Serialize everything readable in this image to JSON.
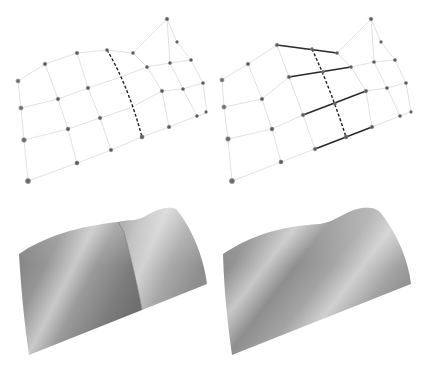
{
  "figure": {
    "colors": {
      "background": "#ffffff",
      "grid_line": "#e2e2e2",
      "control_point": "#5a5a5a",
      "curve_line": "#1e1e1e",
      "surface_base": "#8c8c8c",
      "surface_highlight": "#cfcfcf",
      "surface_shadow": "#6e6e6e"
    },
    "panels": [
      {
        "id": "top-left",
        "kind": "control-net",
        "has_dashed_curve": true,
        "has_solid_segments": false
      },
      {
        "id": "top-right",
        "kind": "control-net",
        "has_dashed_curve": true,
        "has_solid_segments": true,
        "solid_segment_count": 4
      },
      {
        "id": "bottom-left",
        "kind": "shaded-surface",
        "has_crease": true
      },
      {
        "id": "bottom-right",
        "kind": "shaded-surface",
        "has_crease": false
      }
    ]
  }
}
